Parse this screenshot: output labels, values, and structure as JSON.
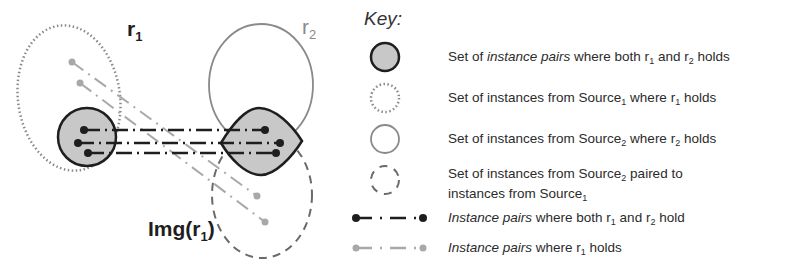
{
  "diagram": {
    "labels": {
      "r1": {
        "base": "r",
        "sub": "1"
      },
      "r2": {
        "base": "r",
        "sub": "2"
      },
      "img": {
        "pre": "Img(r",
        "sub": "1",
        "post": ")"
      }
    },
    "colors": {
      "dark": "#1e1e1e",
      "gray": "#8a8a8a",
      "light_gray": "#a8a8a8",
      "fill": "#c8c8c8"
    }
  },
  "key": {
    "title": "Key:",
    "items": [
      {
        "icon": "filled-circle-icon",
        "parts": [
          {
            "t": "Set of "
          },
          {
            "t": "instance pairs",
            "i": true
          },
          {
            "t": " where both r"
          },
          {
            "t": "1",
            "sub": true
          },
          {
            "t": " and r"
          },
          {
            "t": "2",
            "sub": true
          },
          {
            "t": " holds"
          }
        ]
      },
      {
        "icon": "dotted-circle-icon",
        "parts": [
          {
            "t": "Set of instances from Source"
          },
          {
            "t": "1",
            "sub": true
          },
          {
            "t": " where r"
          },
          {
            "t": "1",
            "sub": true
          },
          {
            "t": " holds"
          }
        ]
      },
      {
        "icon": "solid-circle-icon",
        "parts": [
          {
            "t": "Set of instances from Source"
          },
          {
            "t": "2",
            "sub": true
          },
          {
            "t": " where r"
          },
          {
            "t": "2",
            "sub": true
          },
          {
            "t": " holds"
          }
        ]
      },
      {
        "icon": "dashed-circle-icon",
        "parts": [
          {
            "t": "Set of instances from Source"
          },
          {
            "t": "2",
            "sub": true
          },
          {
            "t": " paired to"
          }
        ],
        "line2": [
          {
            "t": "instances from Source"
          },
          {
            "t": "1",
            "sub": true
          }
        ]
      },
      {
        "icon": "black-dash-dot-line-icon",
        "parts": [
          {
            "t": "Instance pairs",
            "i": true
          },
          {
            "t": " where both r"
          },
          {
            "t": "1",
            "sub": true
          },
          {
            "t": " and r"
          },
          {
            "t": "2",
            "sub": true
          },
          {
            "t": " hold"
          }
        ]
      },
      {
        "icon": "gray-dash-dot-line-icon",
        "parts": [
          {
            "t": "Instance pairs",
            "i": true
          },
          {
            "t": " where r"
          },
          {
            "t": "1",
            "sub": true
          },
          {
            "t": " holds"
          }
        ]
      }
    ]
  }
}
